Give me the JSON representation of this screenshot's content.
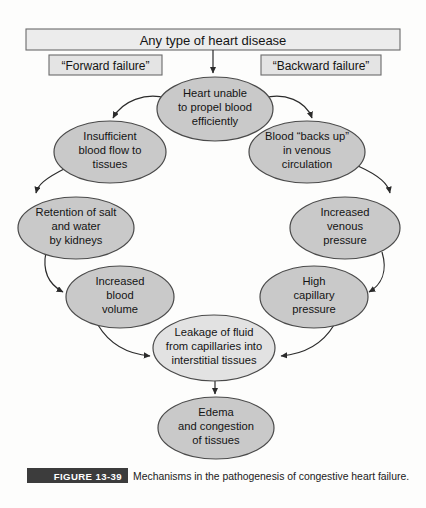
{
  "figure": {
    "tag": "FIGURE 13-39",
    "caption": "Mechanisms in the pathogenesis of congestive heart failure.",
    "tag_bg": "#3c3c3c",
    "tag_color": "#ffffff"
  },
  "header": {
    "title": "Any type of heart disease",
    "box_fill": "#ececec",
    "box_stroke": "#6b6b6b"
  },
  "branch_labels": [
    {
      "id": "forward",
      "text": "“Forward failure”",
      "box_fill": "#e4e4e4"
    },
    {
      "id": "backward",
      "text": "“Backward failure”",
      "box_fill": "#e4e4e4"
    }
  ],
  "palette": {
    "node_fill": "#c9c9c9",
    "node_fill_light": "#e2e2e2",
    "node_stroke": "#4a4a4a",
    "arrow": "#2b2b2b",
    "page_bg": "#fdfdfc"
  },
  "nodes": [
    {
      "id": "heart-unable",
      "lines": [
        "Heart unable",
        "to propel blood",
        "efficiently"
      ],
      "cx": 215,
      "cy": 109,
      "rx": 58,
      "ry": 32,
      "fill": "#c9c9c9"
    },
    {
      "id": "insufficient-blood-flow",
      "lines": [
        "Insufficient",
        "blood flow to",
        "tissues"
      ],
      "cx": 110,
      "cy": 152,
      "rx": 56,
      "ry": 31,
      "fill": "#c9c9c9"
    },
    {
      "id": "blood-backs-up",
      "lines": [
        "Blood “backs up”",
        "in venous",
        "circulation"
      ],
      "cx": 307,
      "cy": 152,
      "rx": 58,
      "ry": 31,
      "fill": "#c9c9c9"
    },
    {
      "id": "retention-salt-water",
      "lines": [
        "Retention of salt",
        "and water",
        "by kidneys"
      ],
      "cx": 76,
      "cy": 228,
      "rx": 58,
      "ry": 31,
      "fill": "#c9c9c9"
    },
    {
      "id": "increased-venous-pressure",
      "lines": [
        "Increased",
        "venous",
        "pressure"
      ],
      "cx": 345,
      "cy": 228,
      "rx": 55,
      "ry": 31,
      "fill": "#c9c9c9"
    },
    {
      "id": "increased-blood-volume",
      "lines": [
        "Increased",
        "blood",
        "volume"
      ],
      "cx": 120,
      "cy": 297,
      "rx": 54,
      "ry": 31,
      "fill": "#c9c9c9"
    },
    {
      "id": "high-capillary-pressure",
      "lines": [
        "High",
        "capillary",
        "pressure"
      ],
      "cx": 314,
      "cy": 297,
      "rx": 54,
      "ry": 31,
      "fill": "#c9c9c9"
    },
    {
      "id": "leakage-of-fluid",
      "lines": [
        "Leakage of fluid",
        "from capillaries into",
        "interstitial tissues"
      ],
      "cx": 214,
      "cy": 348,
      "rx": 61,
      "ry": 33,
      "fill": "#e2e2e2"
    },
    {
      "id": "edema-congestion",
      "lines": [
        "Edema",
        "and congestion",
        "of tissues"
      ],
      "cx": 216,
      "cy": 428,
      "rx": 58,
      "ry": 31,
      "fill": "#c9c9c9"
    }
  ],
  "flow_sequence": [
    "Any type of heart disease",
    "Heart unable to propel blood efficiently",
    "Insufficient blood flow to tissues",
    "Retention of salt and water by kidneys",
    "Increased blood volume",
    "Leakage of fluid from capillaries into interstitial tissues",
    "Edema and congestion of tissues"
  ],
  "flow_sequence_backward": [
    "Heart unable to propel blood efficiently",
    "Blood “backs up” in venous circulation",
    "Increased venous pressure",
    "High capillary pressure",
    "Leakage of fluid from capillaries into interstitial tissues",
    "Edema and congestion of tissues"
  ]
}
